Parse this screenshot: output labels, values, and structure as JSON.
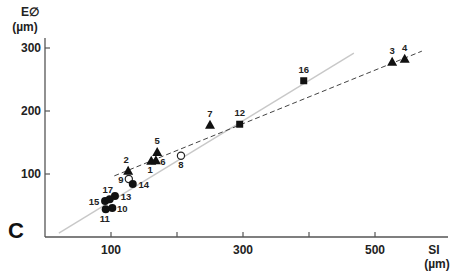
{
  "chart_data": {
    "type": "scatter",
    "panel_label": "C",
    "xlabel": "SI",
    "xunit": "(µm)",
    "ylabel": "E∅",
    "yunit": "(µm)",
    "xlim": [
      0,
      580
    ],
    "ylim": [
      0,
      330
    ],
    "x_ticks": [
      100,
      200,
      300,
      400,
      500
    ],
    "x_tick_labels": [
      "100",
      "",
      "300",
      "",
      "500"
    ],
    "y_ticks": [
      100,
      200,
      300
    ],
    "y_tick_labels": [
      "100",
      "200",
      "300"
    ],
    "grid": false,
    "legend": null,
    "series": [
      {
        "name": "triangles",
        "marker": "filled-triangle",
        "points": [
          {
            "id": "1",
            "x": 161,
            "y": 121
          },
          {
            "id": "2",
            "x": 126,
            "y": 105
          },
          {
            "id": "3",
            "x": 526,
            "y": 278
          },
          {
            "id": "4",
            "x": 545,
            "y": 283
          },
          {
            "id": "5",
            "x": 170,
            "y": 135
          },
          {
            "id": "6",
            "x": 168,
            "y": 122
          },
          {
            "id": "7",
            "x": 250,
            "y": 178
          }
        ]
      },
      {
        "name": "open-circles",
        "marker": "open-circle",
        "points": [
          {
            "id": "8",
            "x": 206,
            "y": 129
          },
          {
            "id": "9",
            "x": 127,
            "y": 92
          }
        ]
      },
      {
        "name": "filled-circles",
        "marker": "filled-circle",
        "points": [
          {
            "id": "10",
            "x": 102,
            "y": 46
          },
          {
            "id": "11",
            "x": 92,
            "y": 44
          },
          {
            "id": "13",
            "x": 106,
            "y": 65
          },
          {
            "id": "14",
            "x": 133,
            "y": 84
          },
          {
            "id": "15",
            "x": 91,
            "y": 57
          },
          {
            "id": "17",
            "x": 98,
            "y": 60
          }
        ]
      },
      {
        "name": "squares",
        "marker": "filled-square",
        "points": [
          {
            "id": "12",
            "x": 295,
            "y": 179
          },
          {
            "id": "16",
            "x": 392,
            "y": 248
          }
        ]
      }
    ],
    "lines": [
      {
        "name": "regression-solid",
        "style": "solid",
        "color": "#c8c8c8",
        "from": [
          21,
          6
        ],
        "to": [
          468,
          292
        ]
      },
      {
        "name": "regression-dashed",
        "style": "dashed",
        "color": "#444444",
        "from": [
          105,
          97
        ],
        "to": [
          571,
          295
        ]
      }
    ]
  }
}
